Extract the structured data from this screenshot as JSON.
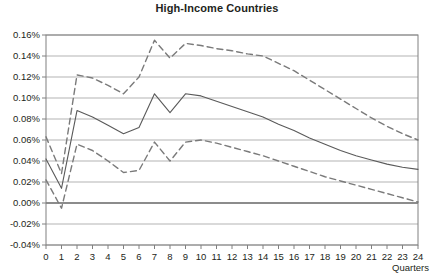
{
  "chart_data": {
    "type": "line",
    "title": "High-Income Countries",
    "xlabel": "Quarters",
    "ylabel": "",
    "x": [
      0,
      1,
      2,
      3,
      4,
      5,
      6,
      7,
      8,
      9,
      10,
      11,
      12,
      13,
      14,
      15,
      16,
      17,
      18,
      19,
      20,
      21,
      22,
      23,
      24
    ],
    "xlim": [
      0,
      24
    ],
    "ylim": [
      -0.04,
      0.16
    ],
    "ytick_values": [
      0.16,
      0.14,
      0.12,
      0.1,
      0.08,
      0.06,
      0.04,
      0.02,
      0.0,
      -0.02,
      -0.04
    ],
    "ytick_labels": [
      "0.16%",
      "0.14%",
      "0.12%",
      "0.10%",
      "0.08%",
      "0.06%",
      "0.04%",
      "0.02%",
      "0.00%",
      "-0.02%",
      "-0.04%"
    ],
    "xtick_labels": [
      "0",
      "1",
      "2",
      "3",
      "4",
      "5",
      "6",
      "7",
      "8",
      "9",
      "10",
      "11",
      "12",
      "13",
      "14",
      "15",
      "16",
      "17",
      "18",
      "19",
      "20",
      "21",
      "22",
      "23",
      "24"
    ],
    "grid": true,
    "legend": "none",
    "zero_line_value": 0.0,
    "series": [
      {
        "name": "Upper confidence band",
        "style": "dashed",
        "color": "#7a7a7a",
        "values": [
          0.063,
          0.028,
          0.122,
          0.119,
          0.112,
          0.104,
          0.12,
          0.155,
          0.138,
          0.152,
          0.15,
          0.147,
          0.145,
          0.142,
          0.14,
          0.133,
          0.126,
          0.117,
          0.108,
          0.099,
          0.09,
          0.081,
          0.073,
          0.066,
          0.06
        ]
      },
      {
        "name": "Point estimate",
        "style": "solid",
        "color": "#5a5a5a",
        "values": [
          0.042,
          0.014,
          0.088,
          0.082,
          0.074,
          0.066,
          0.072,
          0.104,
          0.086,
          0.104,
          0.102,
          0.097,
          0.092,
          0.087,
          0.082,
          0.075,
          0.069,
          0.062,
          0.056,
          0.05,
          0.045,
          0.041,
          0.037,
          0.034,
          0.032
        ]
      },
      {
        "name": "Lower confidence band",
        "style": "dashed",
        "color": "#7a7a7a",
        "values": [
          0.022,
          -0.005,
          0.056,
          0.05,
          0.04,
          0.029,
          0.031,
          0.058,
          0.04,
          0.058,
          0.06,
          0.057,
          0.053,
          0.049,
          0.045,
          0.04,
          0.035,
          0.03,
          0.025,
          0.021,
          0.017,
          0.013,
          0.009,
          0.005,
          0.001
        ]
      }
    ]
  },
  "axes": {
    "frame_color": "#808080",
    "grid_color": "#b3b3b3",
    "zero_line_color": "#666666"
  }
}
